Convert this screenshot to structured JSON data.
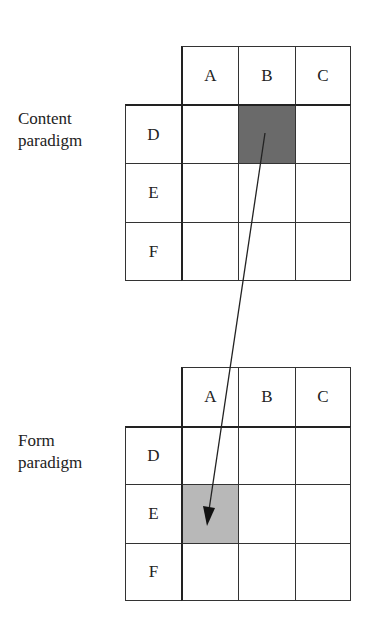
{
  "panels": [
    {
      "label_lines": [
        "Content",
        "paradigm"
      ],
      "columns": [
        "A",
        "B",
        "C"
      ],
      "rows": [
        "D",
        "E",
        "F"
      ],
      "highlighted_cell": {
        "row": "D",
        "col": "B",
        "color": "#6a6a6a"
      }
    },
    {
      "label_lines": [
        "Form",
        "paradigm"
      ],
      "columns": [
        "A",
        "B",
        "C"
      ],
      "rows": [
        "D",
        "E",
        "F"
      ],
      "highlighted_cell": {
        "row": "E",
        "col": "A",
        "color": "#b8b8b8"
      }
    }
  ],
  "arrow": {
    "from": "Content paradigm D-B",
    "to": "Form paradigm E-A"
  }
}
